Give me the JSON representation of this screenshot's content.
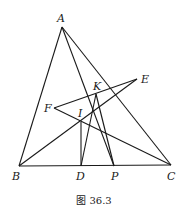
{
  "caption": "图 36.3",
  "points": {
    "A": {
      "label": "A",
      "x": 62,
      "y": 27
    },
    "B": {
      "label": "B",
      "x": 19,
      "y": 166
    },
    "C": {
      "label": "C",
      "x": 171,
      "y": 165
    },
    "D": {
      "label": "D",
      "x": 81,
      "y": 166
    },
    "P": {
      "label": "P",
      "x": 114,
      "y": 166
    },
    "E": {
      "label": "E",
      "x": 137,
      "y": 79
    },
    "F": {
      "label": "F",
      "x": 54,
      "y": 108
    },
    "I": {
      "label": "I",
      "x": 81,
      "y": 122
    },
    "K": {
      "label": "K",
      "x": 96,
      "y": 94
    }
  },
  "segments": [
    [
      "A",
      "B"
    ],
    [
      "A",
      "C"
    ],
    [
      "B",
      "C"
    ],
    [
      "A",
      "P"
    ],
    [
      "B",
      "E"
    ],
    [
      "F",
      "E"
    ],
    [
      "F",
      "C"
    ],
    [
      "I",
      "D"
    ],
    [
      "K",
      "D"
    ],
    [
      "K",
      "P"
    ]
  ]
}
